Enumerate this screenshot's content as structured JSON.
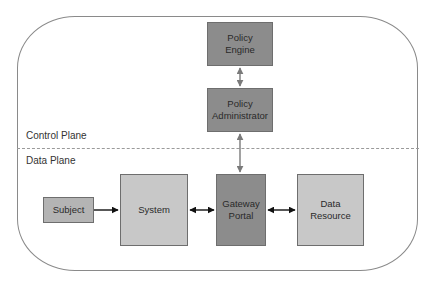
{
  "diagram": {
    "planes": {
      "control": "Control Plane",
      "data": "Data Plane"
    },
    "nodes": {
      "policy_engine": {
        "line1": "Policy",
        "line2": "Engine"
      },
      "policy_administrator": {
        "line1": "Policy",
        "line2": "Administrator"
      },
      "subject": {
        "label": "Subject"
      },
      "system": {
        "label": "System"
      },
      "gateway_portal": {
        "line1": "Gateway",
        "line2": "Portal"
      },
      "data_resource": {
        "line1": "Data",
        "line2": "Resource"
      }
    },
    "edges": [
      {
        "from": "Policy Engine",
        "to": "Policy Administrator",
        "direction": "bidirectional"
      },
      {
        "from": "Policy Administrator",
        "to": "Gateway Portal",
        "direction": "bidirectional"
      },
      {
        "from": "Subject",
        "to": "System",
        "direction": "forward"
      },
      {
        "from": "System",
        "to": "Gateway Portal",
        "direction": "bidirectional"
      },
      {
        "from": "Gateway Portal",
        "to": "Data Resource",
        "direction": "bidirectional"
      }
    ],
    "colors": {
      "dark_box": "#8c8c8c",
      "mid_box": "#b4b4b4",
      "light_box": "#c8c8c8",
      "border": "#6e6e6e",
      "outline": "#8a8a8a",
      "gray_arrow": "#7a7a7a",
      "black_arrow": "#111111"
    }
  }
}
